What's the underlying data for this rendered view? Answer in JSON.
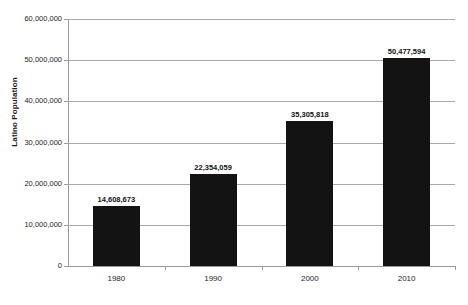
{
  "chart_data": {
    "type": "bar",
    "title": "",
    "xlabel": "",
    "ylabel": "Latino Population",
    "categories": [
      "1980",
      "1990",
      "2000",
      "2010"
    ],
    "values": [
      14608673,
      22354059,
      35305818,
      50477594
    ],
    "value_labels": [
      "14,608,673",
      "22,354,059",
      "35,305,818",
      "50,477,594"
    ],
    "ylim": [
      0,
      60000000
    ],
    "ytick_values": [
      0,
      10000000,
      20000000,
      30000000,
      40000000,
      50000000,
      60000000
    ],
    "ytick_labels": [
      "0",
      "10,000,000",
      "20,000,000",
      "30,000,000",
      "40,000,000",
      "50,000,000",
      "60,000,000"
    ],
    "grid": true,
    "legend": false,
    "bar_color": "#131313",
    "gridline_color": "#a9a9a9",
    "axis_color": "#9a9a9a",
    "background_color": "#ffffff"
  }
}
